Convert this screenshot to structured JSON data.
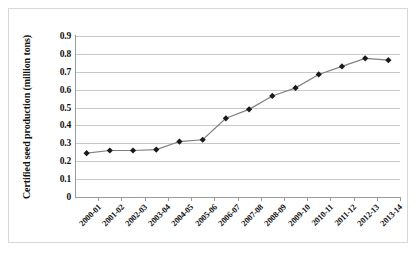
{
  "chart_data": {
    "type": "line",
    "title": "",
    "xlabel": "",
    "ylabel": "Certified seed production (million tons)",
    "categories": [
      "2000-01",
      "2001-02",
      "2002-03",
      "2003-04",
      "2004-05",
      "2005-06",
      "2006-07",
      "2007-08",
      "2008-09",
      "2009-10",
      "2010-11",
      "2011-12",
      "2012-13",
      "2013-14"
    ],
    "values": [
      0.245,
      0.26,
      0.26,
      0.265,
      0.31,
      0.32,
      0.44,
      0.49,
      0.565,
      0.61,
      0.685,
      0.73,
      0.775,
      0.765
    ],
    "series": [
      {
        "name": "Certified seed production",
        "values": [
          0.245,
          0.26,
          0.26,
          0.265,
          0.31,
          0.32,
          0.44,
          0.49,
          0.565,
          0.61,
          0.685,
          0.73,
          0.775,
          0.765
        ]
      }
    ],
    "ylim": [
      0,
      0.9
    ],
    "yticks": [
      "0",
      "0.1",
      "0.2",
      "0.3",
      "0.4",
      "0.5",
      "0.6",
      "0.7",
      "0.8",
      "0.9"
    ],
    "ytick_values": [
      0,
      0.1,
      0.2,
      0.3,
      0.4,
      0.5,
      0.6,
      0.7,
      0.8,
      0.9
    ],
    "grid": "horizontal",
    "legend": "none",
    "marker": "diamond",
    "line_color": "#808080",
    "marker_color": "#1a1a1a",
    "gridline_color": "#c9c9c9",
    "axis_color": "#9a9a9a",
    "background_color": "#ffffff"
  }
}
